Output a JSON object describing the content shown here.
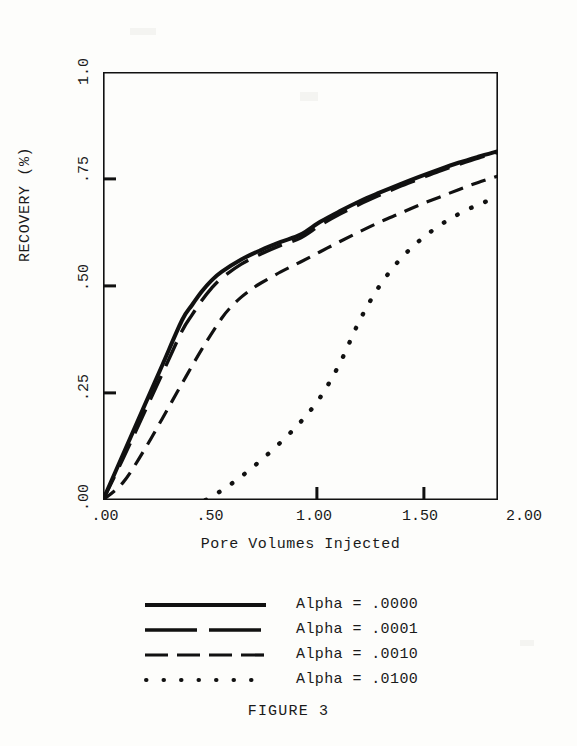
{
  "figure": {
    "caption": "FIGURE 3"
  },
  "axes": {
    "y_title": "RECOVERY (%)",
    "x_title": "Pore Volumes Injected",
    "y_ticks": [
      ".00",
      ".25",
      ".50",
      ".75",
      "1.0"
    ],
    "x_ticks": [
      ".00",
      ".50",
      "1.00",
      "1.50",
      "2.00"
    ]
  },
  "legend": {
    "items": [
      {
        "label": "Alpha = .0000",
        "style": "solid"
      },
      {
        "label": "Alpha = .0001",
        "style": "long-dash"
      },
      {
        "label": "Alpha = .0010",
        "style": "medium-dash"
      },
      {
        "label": "Alpha = .0100",
        "style": "dotted"
      }
    ]
  },
  "chart_data": {
    "type": "line",
    "title": "FIGURE 3",
    "xlabel": "Pore Volumes Injected",
    "ylabel": "RECOVERY (%)",
    "xlim": [
      0.0,
      2.0
    ],
    "ylim": [
      0.0,
      1.0
    ],
    "xticks": [
      0.0,
      0.5,
      1.0,
      1.5,
      2.0
    ],
    "yticks": [
      0.0,
      0.25,
      0.5,
      0.75,
      1.0
    ],
    "xtick_labels": [
      ".00",
      ".50",
      "1.00",
      "1.50",
      "2.00"
    ],
    "ytick_labels": [
      ".00",
      ".25",
      ".50",
      ".75",
      "1.0"
    ],
    "grid": false,
    "legend_position": "below",
    "series": [
      {
        "name": "Alpha = .0000",
        "style": "solid",
        "x": [
          0.0,
          0.1,
          0.2,
          0.3,
          0.4,
          0.45,
          0.5,
          0.55,
          0.6,
          0.7,
          0.8,
          0.9,
          1.0,
          1.1,
          1.2,
          1.3,
          1.4,
          1.5,
          1.6,
          1.7,
          1.8,
          1.9,
          2.0
        ],
        "y": [
          0.0,
          0.105,
          0.21,
          0.315,
          0.42,
          0.455,
          0.487,
          0.513,
          0.533,
          0.562,
          0.584,
          0.603,
          0.62,
          0.65,
          0.675,
          0.698,
          0.718,
          0.737,
          0.755,
          0.772,
          0.788,
          0.802,
          0.815
        ]
      },
      {
        "name": "Alpha = .0001",
        "style": "long-dash",
        "x": [
          0.0,
          0.1,
          0.2,
          0.3,
          0.4,
          0.45,
          0.5,
          0.55,
          0.6,
          0.7,
          0.8,
          0.9,
          1.0,
          1.1,
          1.2,
          1.3,
          1.4,
          1.5,
          1.6,
          1.7,
          1.8,
          1.9,
          2.0
        ],
        "y": [
          0.0,
          0.095,
          0.195,
          0.295,
          0.395,
          0.432,
          0.466,
          0.495,
          0.518,
          0.551,
          0.575,
          0.595,
          0.612,
          0.642,
          0.668,
          0.691,
          0.712,
          0.732,
          0.75,
          0.768,
          0.784,
          0.799,
          0.812
        ]
      },
      {
        "name": "Alpha = .0010",
        "style": "medium-dash",
        "x": [
          0.0,
          0.1,
          0.2,
          0.3,
          0.4,
          0.5,
          0.6,
          0.65,
          0.7,
          0.75,
          0.8,
          0.9,
          1.0,
          1.1,
          1.2,
          1.3,
          1.4,
          1.5,
          1.6,
          1.7,
          1.8,
          1.9,
          2.0
        ],
        "y": [
          0.0,
          0.04,
          0.11,
          0.19,
          0.272,
          0.352,
          0.424,
          0.452,
          0.474,
          0.492,
          0.507,
          0.533,
          0.556,
          0.58,
          0.604,
          0.627,
          0.649,
          0.669,
          0.689,
          0.707,
          0.725,
          0.742,
          0.757
        ]
      },
      {
        "name": "Alpha = .0100",
        "style": "dotted",
        "x": [
          0.52,
          0.6,
          0.7,
          0.8,
          0.9,
          1.0,
          1.1,
          1.2,
          1.3,
          1.4,
          1.5,
          1.6,
          1.7,
          1.8,
          1.9,
          2.0
        ],
        "y": [
          0.0,
          0.022,
          0.055,
          0.093,
          0.135,
          0.182,
          0.24,
          0.32,
          0.42,
          0.5,
          0.56,
          0.605,
          0.64,
          0.668,
          0.69,
          0.708
        ]
      }
    ]
  }
}
